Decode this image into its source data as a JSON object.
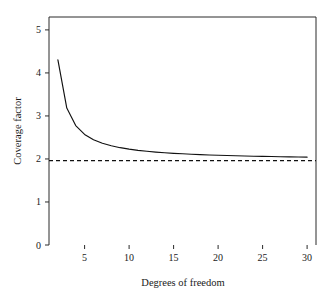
{
  "chart_data": {
    "type": "line",
    "title": "",
    "xlabel": "Degrees of freedom",
    "ylabel": "Coverage factor",
    "xlim": [
      1,
      31
    ],
    "ylim": [
      0,
      5.3
    ],
    "xticks": [
      5,
      10,
      15,
      20,
      25,
      30
    ],
    "yticks": [
      0,
      1,
      2,
      3,
      4,
      5
    ],
    "xtick_labels": [
      "5",
      "10",
      "15",
      "20",
      "25",
      "30"
    ],
    "ytick_labels": [
      "0",
      "1",
      "2",
      "3",
      "4",
      "5"
    ],
    "grid": false,
    "legend": "none",
    "series": [
      {
        "name": "Coverage factor (t, 95%)",
        "style": "solid",
        "x": [
          2,
          3,
          4,
          5,
          6,
          7,
          8,
          9,
          10,
          11,
          12,
          13,
          14,
          15,
          16,
          17,
          18,
          19,
          20,
          21,
          22,
          23,
          24,
          25,
          26,
          27,
          28,
          29,
          30
        ],
        "values": [
          4.303,
          3.182,
          2.776,
          2.571,
          2.447,
          2.365,
          2.306,
          2.262,
          2.228,
          2.201,
          2.179,
          2.16,
          2.145,
          2.131,
          2.12,
          2.11,
          2.101,
          2.093,
          2.086,
          2.08,
          2.074,
          2.069,
          2.064,
          2.06,
          2.056,
          2.052,
          2.048,
          2.045,
          2.042
        ]
      },
      {
        "name": "Asymptote",
        "style": "dashed",
        "x": [
          1,
          31
        ],
        "values": [
          1.96,
          1.96
        ]
      }
    ],
    "annotations": []
  },
  "colors": {
    "curve": "#111111",
    "reference_line": "#111111",
    "axis": "#2b2b2b",
    "text": "#1a1a1a",
    "background": "#ffffff"
  }
}
